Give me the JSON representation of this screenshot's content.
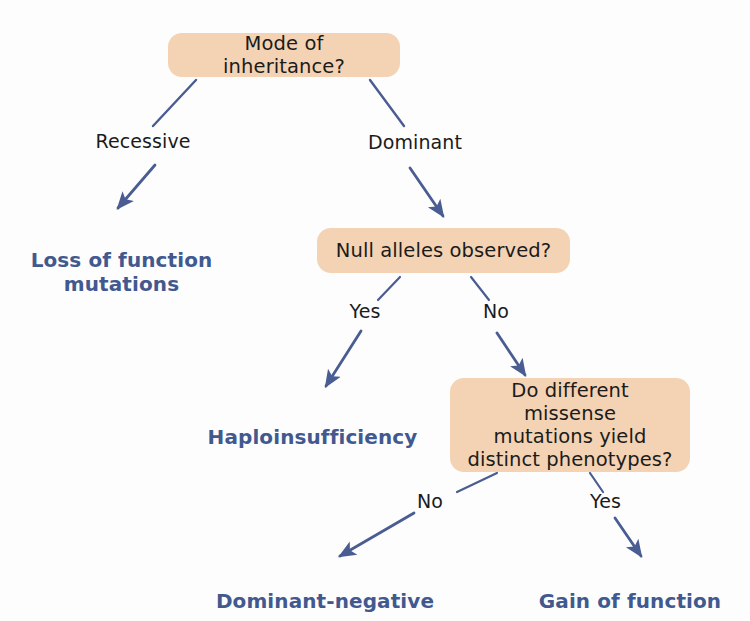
{
  "diagram": {
    "colors": {
      "node_fill": "#f3d3b3",
      "node_text": "#1b1b1b",
      "terminal_text": "#42598f",
      "edge_stroke": "#4a5d92",
      "background": "#fdfdfd"
    },
    "nodes": [
      {
        "id": "mode-of-inheritance",
        "text": "Mode of inheritance?"
      },
      {
        "id": "null-alleles-observed",
        "text": "Null alleles observed?"
      },
      {
        "id": "missense-distinct-phenotypes",
        "text": "Do different missense\nmutations yield\ndistinct phenotypes?"
      }
    ],
    "terminals": [
      {
        "id": "loss-of-function",
        "text": "Loss of function\nmutations"
      },
      {
        "id": "haploinsufficiency",
        "text": "Haploinsufficiency"
      },
      {
        "id": "dominant-negative",
        "text": "Dominant-negative"
      },
      {
        "id": "gain-of-function",
        "text": "Gain of function"
      }
    ],
    "edge_labels": [
      {
        "id": "recessive",
        "text": "Recessive"
      },
      {
        "id": "dominant",
        "text": "Dominant"
      },
      {
        "id": "null-yes",
        "text": "Yes"
      },
      {
        "id": "null-no",
        "text": "No"
      },
      {
        "id": "missense-no",
        "text": "No"
      },
      {
        "id": "missense-yes",
        "text": "Yes"
      }
    ]
  }
}
